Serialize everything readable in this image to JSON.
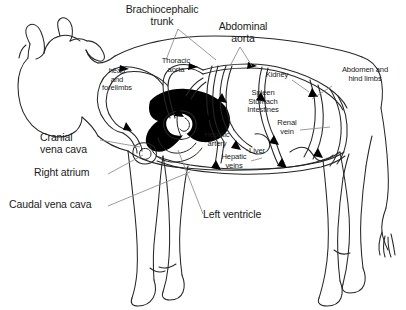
{
  "figure": {
    "background_color": "#ffffff",
    "line_color": "#262626",
    "heart_fill_color": "#000000",
    "leader_line_color": "#777777",
    "text_color": "#1a1a1a"
  },
  "labels": {
    "brachiocephalic_trunk": "Brachiocephalic\ntrunk",
    "abdominal_aorta": "Abdominal\naorta",
    "thoracic_aorta": "Thoracic\naorta",
    "head_and_forelimbs": "head\nand\nforelimbs",
    "kidney": "Kidney",
    "spleen_stomach_intestines": "Spleen\nStomach\nIntestines",
    "abdomen_and_hind_limbs": "Abdomen and\nhind limbs",
    "renal_vein": "Renal\nvein",
    "hepatic_artery": "Hepatic\nartery",
    "hepatic_veins": "Hepatic\nveins",
    "liver": "Liver",
    "cranial_vena_cava": "Cranial\nvena cava",
    "right_atrium": "Right atrium",
    "caudal_vena_cava": "Caudal vena cava",
    "left_ventricle": "Left ventricle"
  },
  "anatomy_structures": [
    "cow body outline",
    "head with horns and ears",
    "four legs with hooves",
    "tail with tuft",
    "heart (solid black)",
    "aortic arch",
    "vascular loops to organs",
    "flow direction arrowheads"
  ]
}
